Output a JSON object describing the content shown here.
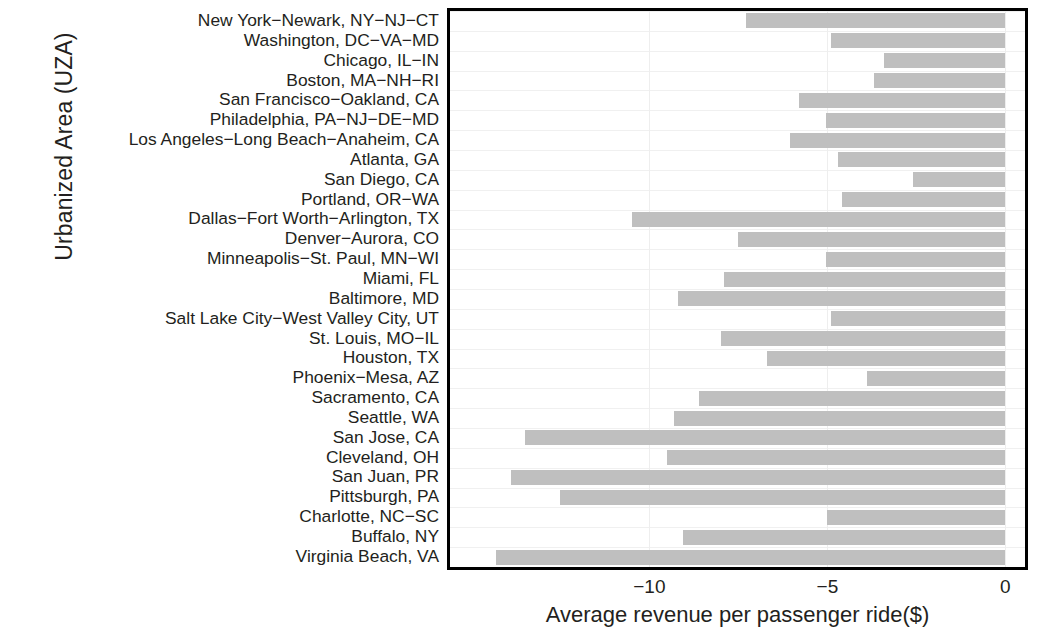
{
  "chart_data": {
    "type": "bar",
    "orientation": "horizontal",
    "title": "",
    "xlabel": "Average revenue per passenger ride($)",
    "ylabel": "Urbanized Area (UZA)",
    "xlim": [
      -15.6,
      0.55
    ],
    "xticks": [
      -10,
      -5,
      0
    ],
    "xticklabels": [
      "−10",
      "−5",
      "0"
    ],
    "grid": true,
    "legend": null,
    "bar_color": "#bfbfbf",
    "categories": [
      "New York−Newark, NY−NJ−CT",
      "Washington, DC−VA−MD",
      "Chicago, IL−IN",
      "Boston, MA−NH−RI",
      "San Francisco−Oakland, CA",
      "Philadelphia, PA−NJ−DE−MD",
      "Los Angeles−Long Beach−Anaheim, CA",
      "Atlanta, GA",
      "San Diego, CA",
      "Portland, OR−WA",
      "Dallas−Fort Worth−Arlington, TX",
      "Denver−Aurora, CO",
      "Minneapolis−St. Paul, MN−WI",
      "Miami, FL",
      "Baltimore, MD",
      "Salt Lake City−West Valley City, UT",
      "St. Louis, MO−IL",
      "Houston, TX",
      "Phoenix−Mesa, AZ",
      "Sacramento, CA",
      "Seattle, WA",
      "San Jose, CA",
      "Cleveland, OH",
      "San Juan, PR",
      "Pittsburgh, PA",
      "Charlotte, NC−SC",
      "Buffalo, NY",
      "Virginia Beach, VA"
    ],
    "values": [
      -7.3,
      -4.9,
      -3.4,
      -3.7,
      -5.8,
      -5.05,
      -6.05,
      -4.7,
      -2.6,
      -4.6,
      -10.5,
      -7.5,
      -5.05,
      -7.9,
      -9.2,
      -4.9,
      -8.0,
      -6.7,
      -3.9,
      -8.6,
      -9.3,
      -13.5,
      -9.5,
      -13.9,
      -12.5,
      -5.0,
      -9.05,
      -14.3
    ]
  }
}
